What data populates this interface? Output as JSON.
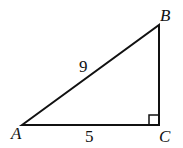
{
  "diagram": {
    "type": "right-triangle",
    "vertices": {
      "A": {
        "label": "A",
        "x": 22,
        "y": 125
      },
      "B": {
        "label": "B",
        "x": 159,
        "y": 25
      },
      "C": {
        "label": "C",
        "x": 159,
        "y": 125
      }
    },
    "sides": {
      "AB": {
        "label": "9"
      },
      "AC": {
        "label": "5"
      }
    },
    "right_angle_at": "C",
    "stroke_color": "#111111"
  }
}
